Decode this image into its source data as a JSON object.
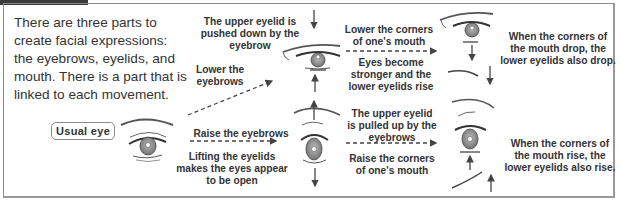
{
  "header": {
    "tab_color": "#3a3a3a"
  },
  "intro": {
    "text": "There are three parts to create facial expressions: the eyebrows, eyelids, and mouth. There is a part that is linked to each movement."
  },
  "usual_eye": {
    "label": "Usual eye"
  },
  "top_branch": {
    "action": "Lower the eyebrows",
    "eyelid_note": "The upper eyelid is pushed down by the eyebrow",
    "mouth_action": "Lower the corners of one's mouth",
    "result": "Eyes become stronger and the lower eyelids rise",
    "conclusion": "When the corners of the mouth drop, the lower eyelids also drop."
  },
  "bottom_branch": {
    "action": "Raise the eyebrows",
    "eyelid_note": "Lifting the eyelids makes the eyes appear to be open",
    "mouth_action": "The upper eyelid is pulled up by the eyebrows",
    "result": "Raise the corners of one's mouth",
    "conclusion": "When the corners of the mouth rise, the lower eyelids also rise."
  },
  "colors": {
    "text": "#333333",
    "border": "#8a8a8a",
    "line": "#444444",
    "iris": "#888888"
  }
}
